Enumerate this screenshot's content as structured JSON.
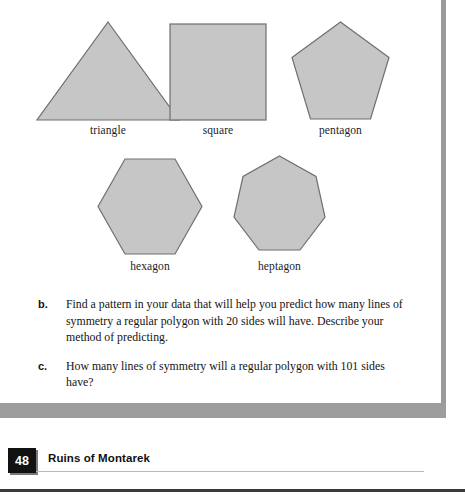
{
  "page": {
    "number": "48",
    "running_title": "Ruins of Montarek"
  },
  "figure": {
    "shapes": [
      {
        "name": "triangle",
        "label": "triangle",
        "sides": 3,
        "fill": "#c6c6c6",
        "stroke": "#6f6f6f"
      },
      {
        "name": "square",
        "label": "square",
        "sides": 4,
        "fill": "#c6c6c6",
        "stroke": "#6f6f6f"
      },
      {
        "name": "pentagon",
        "label": "pentagon",
        "sides": 5,
        "fill": "#c6c6c6",
        "stroke": "#6f6f6f"
      },
      {
        "name": "hexagon",
        "label": "hexagon",
        "sides": 6,
        "fill": "#c6c6c6",
        "stroke": "#6f6f6f"
      },
      {
        "name": "heptagon",
        "label": "heptagon",
        "sides": 7,
        "fill": "#c6c6c6",
        "stroke": "#6f6f6f"
      }
    ]
  },
  "exercises": [
    {
      "marker": "b.",
      "text": "Find a pattern in your data that will help you predict how many lines of symmetry a regular polygon with 20 sides will have. Describe your method of predicting."
    },
    {
      "marker": "c.",
      "text": "How many lines of symmetry will a regular polygon with 101 sides have?"
    }
  ],
  "colors": {
    "shape_fill": "#c6c6c6",
    "shape_stroke": "#6f6f6f",
    "page_frame": "#9a9a9a",
    "badge_background": "#121212",
    "badge_text": "#ffffff"
  }
}
